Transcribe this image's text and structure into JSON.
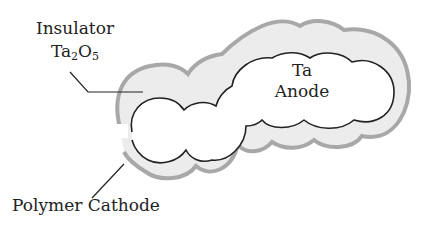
{
  "diagram": {
    "labels": {
      "insulator_line1": "Insulator",
      "insulator_formula_main": "Ta",
      "insulator_formula_sub1": "2",
      "insulator_formula_o": "O",
      "insulator_formula_sub2": "5",
      "anode_line1": "Ta",
      "anode_line2": "Anode",
      "cathode": "Polymer Cathode"
    },
    "colors": {
      "insulator_fill": "#ececec",
      "cathode_stroke": "#a8a8a8",
      "anode_stroke": "#222222",
      "leader_line": "#222222"
    }
  }
}
